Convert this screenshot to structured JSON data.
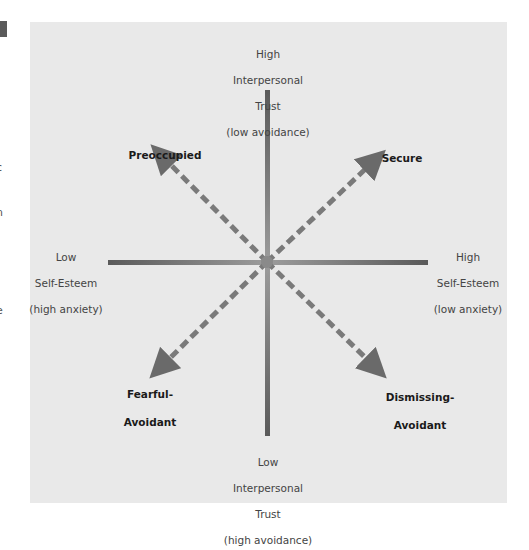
{
  "margin": {
    "edge_fragments": [
      {
        "text": "c",
        "y": 168
      },
      {
        "text": "n",
        "y": 213
      },
      {
        "text": "e",
        "y": 311
      }
    ]
  },
  "axes": {
    "top": {
      "line1": "High",
      "line2": "Interpersonal",
      "line3": "Trust",
      "line4": "(low avoidance)"
    },
    "bottom": {
      "line1": "Low",
      "line2": "Interpersonal",
      "line3": "Trust",
      "line4": "(high avoidance)"
    },
    "left": {
      "line1": "Low",
      "line2": "Self-Esteem",
      "line3": "(high anxiety)"
    },
    "right": {
      "line1": "High",
      "line2": "Self-Esteem",
      "line3": "(low anxiety)"
    }
  },
  "styles": {
    "top_left": {
      "line1": "Preoccupied"
    },
    "top_right": {
      "line1": "Secure"
    },
    "bottom_left": {
      "line1": "Fearful-",
      "line2": "Avoidant"
    },
    "bottom_right": {
      "line1": "Dismissing-",
      "line2": "Avoidant"
    }
  },
  "colors": {
    "panel_bg": "#e9e9e9",
    "axis_dark": "#5e5e5e",
    "axis_light": "#9a9a9a",
    "arrow": "#7a7a7a",
    "text_bold": "#1a1a1a",
    "text_axis": "#444444"
  }
}
